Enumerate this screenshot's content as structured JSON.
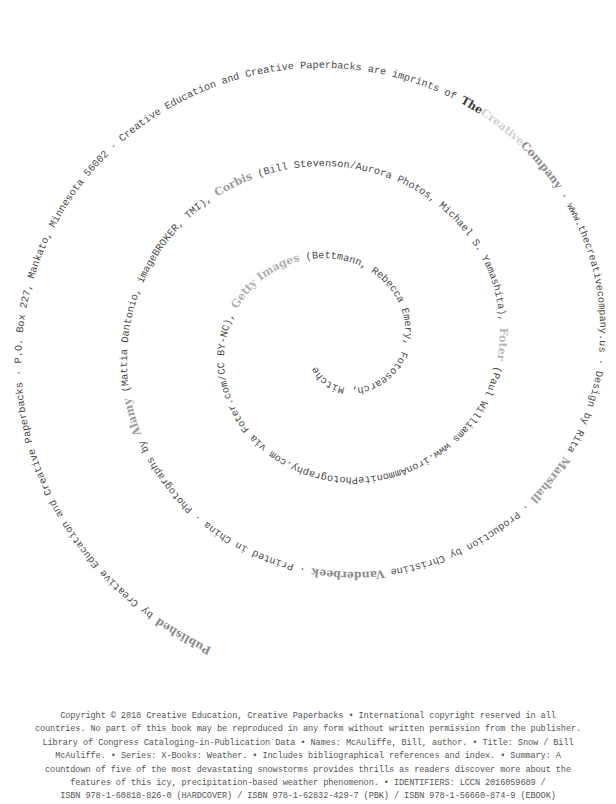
{
  "page": {
    "background": "#ffffff",
    "text_color": "#4a4a4a"
  },
  "spiral": {
    "center": [
      338,
      345
    ],
    "segments": [
      {
        "text": "Published",
        "style": "logo",
        "color": "#8a8a8a"
      },
      {
        "text": " by Creative Education and Creative Paperbacks · P.O. Box 227, Mankato, Minnesota 56002 · Creative Education and Creative Paperbacks are imprints of ",
        "style": "plain"
      },
      {
        "text": "The",
        "style": "logo",
        "color": "#3a3a3a"
      },
      {
        "text": "Creative",
        "style": "logo",
        "color": "#d0d0d0"
      },
      {
        "text": "Company",
        "style": "logo",
        "color": "#8a8a8a"
      },
      {
        "text": " · www.thecreativecompany.us · Design by Rita ",
        "style": "plain"
      },
      {
        "text": "Marshall",
        "style": "logo",
        "color": "#9a9a9a"
      },
      {
        "text": " · Production by Christine ",
        "style": "plain"
      },
      {
        "text": "Vanderbeek",
        "style": "logo",
        "color": "#8a8a8a"
      },
      {
        "text": " · Printed in China · Photographs by ",
        "style": "plain"
      },
      {
        "text": "Alamy",
        "style": "logo",
        "color": "#9a9a9a"
      },
      {
        "text": " (Mattia Dantonio, imageBROKER, TMI), ",
        "style": "plain"
      },
      {
        "text": "Corbis",
        "style": "logo",
        "color": "#9a9a9a"
      },
      {
        "text": " (Bill Stevenson/Aurora Photos, Michael S. Yamashita), ",
        "style": "plain"
      },
      {
        "text": "Foter",
        "style": "logo",
        "color": "#b8b8b8"
      },
      {
        "text": " (Paul Williams www.ironAmmonitePhotography.com via Foter.com/CC BY-NC), ",
        "style": "plain"
      },
      {
        "text": "Getty Images",
        "style": "logo",
        "color": "#b0b0b0"
      },
      {
        "text": " (Bettmann, Rebecca Emery, Fotosearch, Mitchell Funk, David W. Hamilton), ",
        "style": "plain"
      },
      {
        "text": "iStockphoto",
        "style": "logo",
        "color": "#d0d0d0"
      },
      {
        "text": " (Don Komarechka 2009, Jonathan Lesage, tatulaju), ",
        "style": "plain"
      },
      {
        "text": "Shutterstock",
        "style": "logo",
        "color": "#3a3a3a"
      },
      {
        "text": " (boscorelli, Jorg Hackemann, Kudryashka, Yegor Larin, Stephen Marques, Romas_Photo, Yaping)",
        "style": "plain"
      }
    ]
  },
  "copyright": {
    "lines": [
      "Copyright © 2018 Creative Education, Creative Paperbacks • International copyright reserved in all",
      "countries. No part of this book may be reproduced in any form without written permission from the publisher.",
      "Library of Congress Cataloging-in-Publication Data • Names: McAuliffe, Bill, author. • Title: Snow / Bill",
      "McAuliffe. • Series: X-Books: Weather. • Includes bibliographical references and index. • Summary: A",
      "countdown of five of the most devastating snowstorms provides thrills as readers discover more about the",
      "features of this icy, precipitation-based weather phenomenon. • IDENTIFIERS: LCCN 2016059689 /",
      "ISBN 978-1-60818-826-0 (HARDCOVER) / ISBN 978-1-62832-429-7 (PBK) / ISBN 978-1-56660-874-9 (EBOOK)"
    ]
  }
}
